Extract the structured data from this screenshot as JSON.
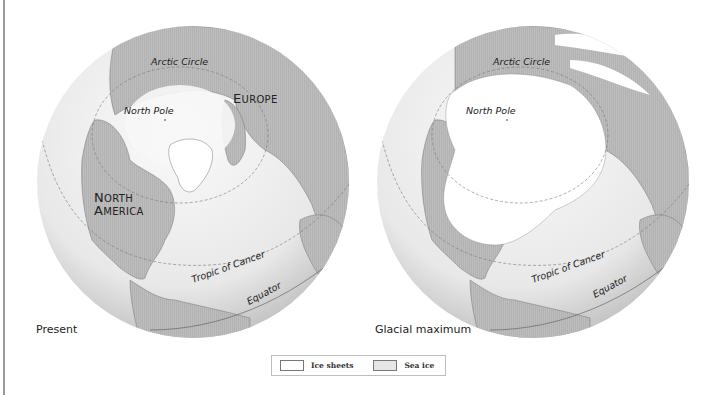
{
  "figure": {
    "type": "paired polar globe maps",
    "colors": {
      "ocean_light": "#f2f2f2",
      "ocean_shade": "#cfcfcf",
      "land": "#bdbdbd",
      "ice_sheet": "#ffffff",
      "sea_ice": "#ececec",
      "line": "#555555",
      "page_border": "#9a9a9a"
    }
  },
  "maps": [
    {
      "id": "present",
      "caption": "Present",
      "labels": {
        "arctic_circle": "Arctic Circle",
        "north_pole": "North Pole",
        "europe_first": "E",
        "europe_rest": "UROPE",
        "north_first": "N",
        "north_rest": "ORTH",
        "america_first": "A",
        "america_rest": "MERICA",
        "tropic": "Tropic of Cancer",
        "equator": "Equator"
      }
    },
    {
      "id": "glacial-maximum",
      "caption": "Glacial maximum",
      "labels": {
        "arctic_circle": "Arctic Circle",
        "north_pole": "North Pole",
        "tropic": "Tropic of Cancer",
        "equator": "Equator"
      }
    }
  ],
  "legend": {
    "items": [
      {
        "label": "Ice sheets",
        "swatch_color": "#ffffff"
      },
      {
        "label": "Sea ice",
        "swatch_color": "#e6e6e6"
      }
    ]
  }
}
